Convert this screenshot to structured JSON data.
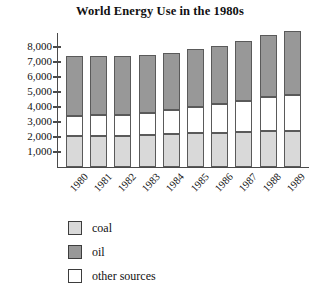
{
  "chart_data": {
    "type": "bar",
    "subtype": "stacked-bar",
    "title": "World Energy Use in the 1980s",
    "xlabel": "",
    "ylabel": "",
    "ylim": [
      0,
      9500
    ],
    "grid": false,
    "legend_position": "bottom-left",
    "categories": [
      "1980",
      "1981",
      "1982",
      "1983",
      "1984",
      "1985",
      "1986",
      "1987",
      "1988",
      "1989"
    ],
    "ytick_values": [
      1000,
      2000,
      3000,
      4000,
      5000,
      6000,
      7000,
      8000
    ],
    "ytick_labels": [
      "1,000",
      "2,000",
      "3,000",
      "4,000",
      "5,000",
      "6,000",
      "7,000",
      "8,000"
    ],
    "stack_order_bottom_to_top": [
      "coal",
      "other sources",
      "oil"
    ],
    "series": [
      {
        "name": "coal",
        "color": "#d9d9d9",
        "values": [
          2100,
          2100,
          2100,
          2150,
          2200,
          2250,
          2300,
          2350,
          2400,
          2400
        ]
      },
      {
        "name": "other sources",
        "color": "#ffffff",
        "values": [
          1300,
          1350,
          1400,
          1450,
          1600,
          1750,
          1900,
          2050,
          2250,
          2400
        ]
      },
      {
        "name": "oil",
        "color": "#989898",
        "values": [
          4000,
          3950,
          3900,
          3850,
          3800,
          3850,
          3850,
          4000,
          4150,
          4300
        ]
      }
    ],
    "totals": [
      7400,
      7400,
      7400,
      7450,
      7600,
      7850,
      8050,
      8400,
      8800,
      9100
    ]
  },
  "legend": {
    "entries": [
      {
        "label": "coal",
        "color": "#d9d9d9"
      },
      {
        "label": "oil",
        "color": "#989898"
      },
      {
        "label": "other sources",
        "color": "#ffffff"
      }
    ]
  }
}
